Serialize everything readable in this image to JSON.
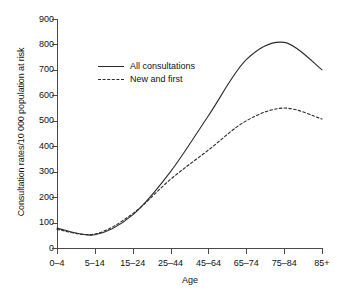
{
  "chart_data": {
    "type": "line",
    "title": "",
    "subtitle": "",
    "xlabel": "Age",
    "ylabel": "Consultation rates/10 000 population at risk",
    "categories": [
      "0–4",
      "5–14",
      "15–24",
      "25–44",
      "45–64",
      "65–74",
      "75–84",
      "85+"
    ],
    "ylim": [
      0,
      900
    ],
    "yticks": [
      900,
      800,
      700,
      600,
      500,
      400,
      300,
      200,
      100,
      0
    ],
    "grid": false,
    "legend_position": "upper-left-inside",
    "series": [
      {
        "name": "All consultations",
        "style": "solid",
        "color": "#2b2b2b",
        "values": [
          78,
          52,
          130,
          300,
          520,
          740,
          808,
          700
        ]
      },
      {
        "name": "New and first",
        "style": "dashed",
        "color": "#2b2b2b",
        "values": [
          73,
          55,
          135,
          270,
          385,
          500,
          550,
          507
        ]
      }
    ]
  },
  "legend": {
    "items": [
      {
        "label": "All consultations",
        "style": "solid"
      },
      {
        "label": "New and first",
        "style": "dashed"
      }
    ]
  }
}
